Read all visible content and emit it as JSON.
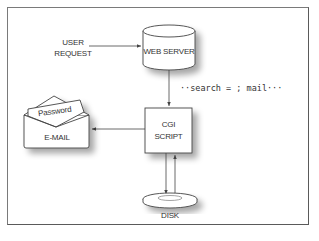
{
  "diagram": {
    "nodes": {
      "user_request": {
        "line1": "USER",
        "line2": "REQUEST"
      },
      "web_server": {
        "label": "WEB SERVER",
        "shape": "cylinder"
      },
      "cgi_script": {
        "line1": "CGI",
        "line2": "SCRIPT",
        "shape": "box"
      },
      "email": {
        "label": "E-MAIL",
        "letter_label": "Password",
        "shape": "envelope"
      },
      "disk": {
        "label": "DISK",
        "shape": "disk"
      }
    },
    "annotation": "··search = ; mail···",
    "edges": [
      {
        "from": "user_request",
        "to": "web_server"
      },
      {
        "from": "web_server",
        "to": "cgi_script"
      },
      {
        "from": "cgi_script",
        "to": "email"
      },
      {
        "from": "cgi_script",
        "to": "disk"
      },
      {
        "from": "disk",
        "to": "cgi_script"
      }
    ]
  },
  "colors": {
    "line": "#444444",
    "shadow": "#bdbdbd",
    "frame": "#7a7a7a"
  }
}
